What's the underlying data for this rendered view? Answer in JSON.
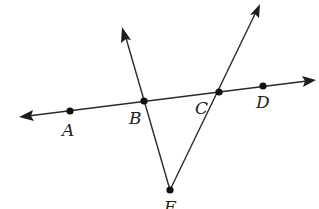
{
  "diagram": {
    "type": "geometry",
    "colors": {
      "stroke": "#2a2a2a",
      "point": "#111111",
      "background": "#ffffff"
    },
    "points": [
      {
        "label": "A",
        "x": 70,
        "y": 111
      },
      {
        "label": "B",
        "x": 144,
        "y": 101
      },
      {
        "label": "C",
        "x": 219,
        "y": 92
      },
      {
        "label": "D",
        "x": 263,
        "y": 86
      },
      {
        "label": "F",
        "x": 170,
        "y": 190
      }
    ],
    "labels": {
      "A": "A",
      "B": "B",
      "C": "C",
      "D": "D",
      "F": "F"
    },
    "lines": [
      {
        "name": "line-AD",
        "from": [
          20,
          117
        ],
        "to": [
          315,
          80
        ],
        "arrows": "both"
      },
      {
        "name": "ray-FB",
        "from": [
          170,
          190
        ],
        "to": [
          123,
          28
        ],
        "arrows": "end"
      },
      {
        "name": "ray-FC",
        "from": [
          170,
          190
        ],
        "to": [
          259,
          5
        ],
        "arrows": "end"
      }
    ]
  }
}
